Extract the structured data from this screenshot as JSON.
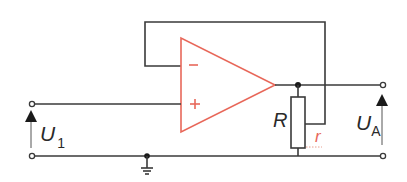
{
  "diagram": {
    "type": "op-amp circuit (non-inverting voltage follower with potentiometer output)",
    "colors": {
      "wire": "#3a3a3a",
      "opamp": "#e8685a",
      "wiper_label": "#e8685a",
      "background": "#ffffff"
    },
    "opamp": {
      "minus_label": "-",
      "plus_label": "+"
    },
    "labels": {
      "input_voltage_main": "U",
      "input_voltage_sub": "1",
      "output_voltage_main": "U",
      "output_voltage_sub": "A",
      "resistor": "R",
      "wiper": "r"
    }
  }
}
